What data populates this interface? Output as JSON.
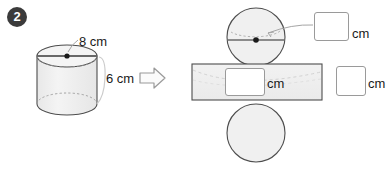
{
  "problem": {
    "number": "2",
    "transform_icon": "right-arrow-icon"
  },
  "cylinder": {
    "diameter_label": "8 cm",
    "height_label": "6 cm",
    "center_dot": "center-point"
  },
  "net": {
    "top_circle_answer": "",
    "top_circle_unit": "cm",
    "rectangle_answer": "",
    "rectangle_unit": "cm",
    "rectangle_right_answer": "",
    "rectangle_right_unit": "cm",
    "bottom_circle_label": ""
  },
  "colors": {
    "badge_bg": "#3b3b3b",
    "badge_text": "#ffffff",
    "shape_fill": "#f0f0f0",
    "shape_stroke": "#4d4d4d",
    "hidden_edge": "#9a9a9a",
    "leader_line": "#a5a5a5",
    "text": "#1a1a1a",
    "box_border": "#9a9a9a",
    "arrow_stroke": "#9a9a9a"
  }
}
